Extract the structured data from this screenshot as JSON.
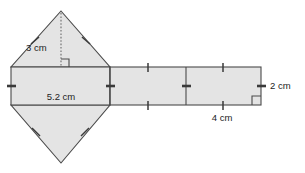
{
  "figure": {
    "background_color": "#ffffff",
    "fill_color": "#e4e4e4",
    "stroke_color": "#4a4a4a",
    "labels": {
      "triangle_height": "3 cm",
      "base_width": "5.2 cm",
      "rectangle_width": "4 cm",
      "rectangle_height": "2 cm"
    },
    "parts": {
      "top_triangle": "top-triangle",
      "bottom_triangle": "bottom-triangle",
      "left_rectangle": "left-rectangle",
      "right_rectangle": "right-rectangle"
    },
    "markers": {
      "right_angle_altitude": "right-angle-marker-altitude",
      "right_angle_corner": "right-angle-marker-corner",
      "altitude": "altitude-dotted-line"
    }
  }
}
